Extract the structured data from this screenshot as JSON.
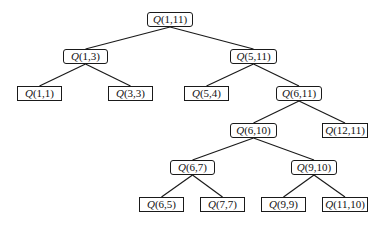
{
  "diagram": {
    "type": "binary-tree",
    "symbol": "Q",
    "nodes": [
      {
        "id": "n1",
        "label": "(1,11)",
        "kind": "internal",
        "x": 147,
        "y": 12,
        "w": 46
      },
      {
        "id": "n2",
        "label": "(1,3)",
        "kind": "internal",
        "x": 63,
        "y": 49,
        "w": 45
      },
      {
        "id": "n3",
        "label": "(5,11)",
        "kind": "internal",
        "x": 230,
        "y": 49,
        "w": 47
      },
      {
        "id": "n4",
        "label": "(1,1)",
        "kind": "leaf",
        "x": 17,
        "y": 86,
        "w": 45
      },
      {
        "id": "n5",
        "label": "(3,3)",
        "kind": "leaf",
        "x": 108,
        "y": 86,
        "w": 45
      },
      {
        "id": "n6",
        "label": "(5,4)",
        "kind": "leaf",
        "x": 184,
        "y": 86,
        "w": 45
      },
      {
        "id": "n7",
        "label": "(6,11)",
        "kind": "internal",
        "x": 276,
        "y": 86,
        "w": 46
      },
      {
        "id": "n8",
        "label": "(6,10)",
        "kind": "internal",
        "x": 230,
        "y": 123,
        "w": 47
      },
      {
        "id": "n9",
        "label": "(12,11)",
        "kind": "leaf",
        "x": 322,
        "y": 123,
        "w": 46
      },
      {
        "id": "n10",
        "label": "(6,7)",
        "kind": "internal",
        "x": 170,
        "y": 160,
        "w": 45
      },
      {
        "id": "n11",
        "label": "(9,10)",
        "kind": "internal",
        "x": 291,
        "y": 160,
        "w": 46
      },
      {
        "id": "n12",
        "label": "(6,5)",
        "kind": "leaf",
        "x": 139,
        "y": 197,
        "w": 45
      },
      {
        "id": "n13",
        "label": "(7,7)",
        "kind": "leaf",
        "x": 200,
        "y": 197,
        "w": 45
      },
      {
        "id": "n14",
        "label": "(9,9)",
        "kind": "leaf",
        "x": 261,
        "y": 197,
        "w": 45
      },
      {
        "id": "n15",
        "label": "(11,10)",
        "kind": "leaf",
        "x": 322,
        "y": 197,
        "w": 46
      }
    ],
    "edges": [
      [
        "n1",
        "n2"
      ],
      [
        "n1",
        "n3"
      ],
      [
        "n2",
        "n4"
      ],
      [
        "n2",
        "n5"
      ],
      [
        "n3",
        "n6"
      ],
      [
        "n3",
        "n7"
      ],
      [
        "n7",
        "n8"
      ],
      [
        "n7",
        "n9"
      ],
      [
        "n8",
        "n10"
      ],
      [
        "n8",
        "n11"
      ],
      [
        "n10",
        "n12"
      ],
      [
        "n10",
        "n13"
      ],
      [
        "n11",
        "n14"
      ],
      [
        "n11",
        "n15"
      ]
    ]
  }
}
